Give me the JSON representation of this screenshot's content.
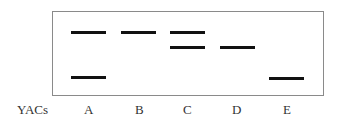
{
  "diagram": {
    "type": "gel-electrophoresis",
    "row_label": "YACs",
    "lanes": [
      {
        "label": "A",
        "x": 71,
        "bands": [
          32,
          77
        ]
      },
      {
        "label": "B",
        "x": 121,
        "bands": [
          32
        ]
      },
      {
        "label": "C",
        "x": 170,
        "bands": [
          32,
          47
        ]
      },
      {
        "label": "D",
        "x": 220,
        "bands": [
          47
        ]
      },
      {
        "label": "E",
        "x": 269,
        "bands": [
          78
        ]
      }
    ],
    "band_width": 35,
    "band_color": "#111111",
    "border_color": "#8a8a8a"
  }
}
